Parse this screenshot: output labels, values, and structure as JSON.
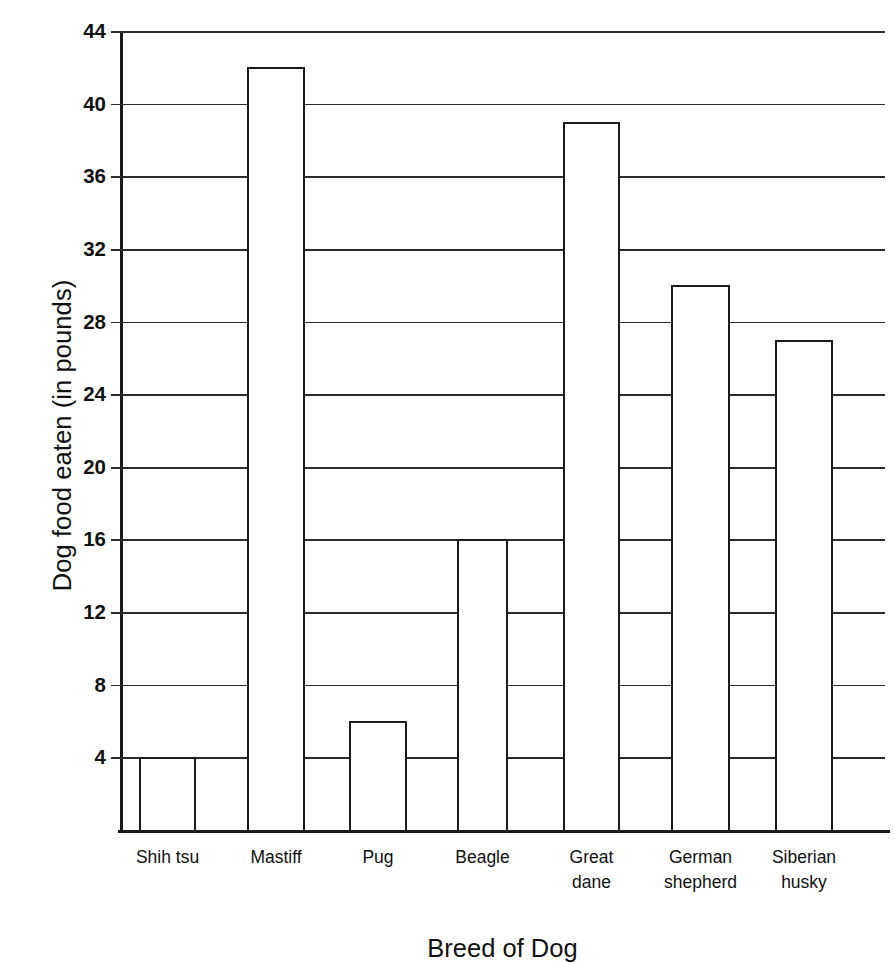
{
  "chart_data": {
    "type": "bar",
    "title": "",
    "xlabel": "Breed of Dog",
    "ylabel": "Dog food eaten (in pounds)",
    "categories": [
      "Shih tsu",
      "Mastiff",
      "Pug",
      "Beagle",
      "Great dane",
      "German shepherd",
      "Siberian husky"
    ],
    "category_lines": [
      [
        "Shih tsu"
      ],
      [
        "Mastiff"
      ],
      [
        "Pug"
      ],
      [
        "Beagle"
      ],
      [
        "Great",
        "dane"
      ],
      [
        "German",
        "shepherd"
      ],
      [
        "Siberian",
        "husky"
      ]
    ],
    "values": [
      4,
      42,
      6,
      16,
      39,
      30,
      27
    ],
    "ylim": [
      0,
      44
    ],
    "yticks": [
      4,
      8,
      12,
      16,
      20,
      24,
      28,
      32,
      36,
      40,
      44
    ],
    "ytick_labels": [
      "4",
      "8",
      "12",
      "16",
      "20",
      "24",
      "28",
      "32",
      "36",
      "40",
      "44"
    ],
    "grid": true,
    "legend": "none",
    "colors": {
      "bar_fill": "#ffffff",
      "bar_stroke": "#1a1a1a",
      "grid": "#2b2b2b",
      "axis": "#1a1a1a",
      "text": "#111111",
      "background": "#ffffff"
    }
  },
  "axis": {
    "y_title": "Dog food eaten (in pounds)",
    "x_title": "Breed of Dog"
  }
}
